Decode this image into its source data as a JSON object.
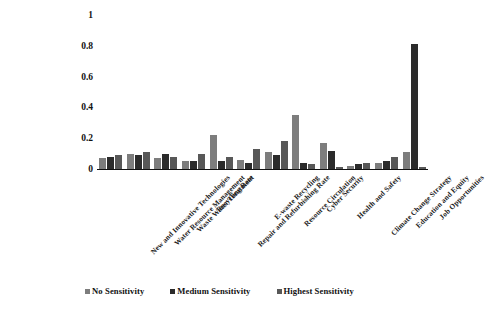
{
  "chart_data": {
    "type": "bar",
    "title": "",
    "subtitle": "",
    "xlabel": "",
    "ylabel": "",
    "ylim": [
      0,
      1
    ],
    "grid": false,
    "legend_position": "bottom",
    "yticks": [
      "1",
      "0.8",
      "0.6",
      "0.4",
      "0.2",
      "0"
    ],
    "ytick_values": [
      1,
      0.8,
      0.6,
      0.4,
      0.2,
      0
    ],
    "categories": [
      "New and Innovative Technologies",
      "Water Resource Management",
      "Waste Water Treatment",
      "Recycling Rate",
      "Repair and Refurbishing Rate",
      "E-waste Recycling",
      "Resource Circulation",
      "Cyber Security",
      "Health and Safety",
      "Climate Change Strategy",
      "Education and Equity",
      "Job Opportunities"
    ],
    "series": [
      {
        "name": "No Sensitivity",
        "color": "#7d7d7d",
        "values": [
          0.07,
          0.1,
          0.07,
          0.05,
          0.22,
          0.06,
          0.11,
          0.35,
          0.17,
          0.02,
          0.04,
          0.11
        ]
      },
      {
        "name": "Medium Sensitivity",
        "color": "#2b2b2b",
        "values": [
          0.08,
          0.09,
          0.1,
          0.05,
          0.05,
          0.04,
          0.09,
          0.04,
          0.12,
          0.03,
          0.05,
          0.81
        ]
      },
      {
        "name": "Highest Sensitivity",
        "color": "#585858",
        "values": [
          0.09,
          0.11,
          0.08,
          0.1,
          0.08,
          0.13,
          0.18,
          0.03,
          0.01,
          0.04,
          0.08,
          0.01
        ]
      }
    ]
  },
  "legend": {
    "items": [
      {
        "label": "No Sensitivity",
        "color": "#7d7d7d"
      },
      {
        "label": "Medium Sensitivity",
        "color": "#2b2b2b"
      },
      {
        "label": "Highest Sensitivity",
        "color": "#585858"
      }
    ]
  }
}
